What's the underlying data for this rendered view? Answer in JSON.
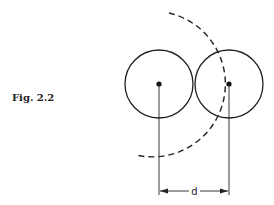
{
  "figure": {
    "caption": "Fig. 2.2",
    "dimension_label": "d"
  }
}
